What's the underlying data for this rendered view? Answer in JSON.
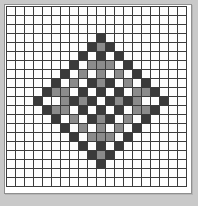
{
  "app": {
    "title": "Pixel Grid Editor",
    "canvas_name": "pattern-canvas"
  },
  "grid": {
    "columns": 20,
    "rows": 20,
    "cell_size_px": 9,
    "gridline_color": "#3b3b3b",
    "background_color": "#fdfdfd",
    "border_color": "#8f8f8f",
    "frame_color": "#c9c9c9"
  },
  "palette": {
    "empty": "#fdfdfd",
    "dark": "#3a3a3a",
    "mid": "#8b8b8b"
  },
  "chart_data": {
    "type": "heatmap",
    "xlabel": "",
    "ylabel": "",
    "legend": [
      "empty",
      "dark",
      "mid"
    ],
    "value_colors": {
      "0": "#fdfdfd",
      "1": "#3a3a3a",
      "2": "#8b8b8b"
    },
    "rows": 20,
    "columns": 20,
    "cells": [
      [
        0,
        0,
        0,
        0,
        0,
        0,
        0,
        0,
        0,
        0,
        0,
        0,
        0,
        0,
        0,
        0,
        0,
        0,
        0,
        0
      ],
      [
        0,
        0,
        0,
        0,
        0,
        0,
        0,
        0,
        0,
        0,
        0,
        0,
        0,
        0,
        0,
        0,
        0,
        0,
        0,
        0
      ],
      [
        0,
        0,
        0,
        0,
        0,
        0,
        0,
        0,
        0,
        0,
        0,
        0,
        0,
        0,
        0,
        0,
        0,
        0,
        0,
        0
      ],
      [
        0,
        0,
        0,
        0,
        0,
        0,
        0,
        0,
        0,
        0,
        1,
        0,
        0,
        0,
        0,
        0,
        0,
        0,
        0,
        0
      ],
      [
        0,
        0,
        0,
        0,
        0,
        0,
        0,
        0,
        0,
        1,
        2,
        1,
        0,
        0,
        0,
        0,
        0,
        0,
        0,
        0
      ],
      [
        0,
        0,
        0,
        0,
        0,
        0,
        0,
        0,
        1,
        0,
        1,
        0,
        1,
        0,
        0,
        0,
        0,
        0,
        0,
        0
      ],
      [
        0,
        0,
        0,
        0,
        0,
        0,
        0,
        1,
        0,
        2,
        2,
        2,
        0,
        1,
        0,
        0,
        0,
        0,
        0,
        0
      ],
      [
        0,
        0,
        0,
        0,
        0,
        0,
        1,
        0,
        2,
        0,
        2,
        0,
        2,
        0,
        1,
        0,
        0,
        0,
        0,
        0
      ],
      [
        0,
        0,
        0,
        0,
        0,
        1,
        0,
        2,
        0,
        1,
        2,
        1,
        0,
        2,
        0,
        1,
        0,
        0,
        0,
        0
      ],
      [
        0,
        0,
        0,
        0,
        1,
        2,
        2,
        0,
        1,
        0,
        1,
        0,
        1,
        0,
        2,
        2,
        1,
        0,
        0,
        0
      ],
      [
        0,
        0,
        0,
        1,
        0,
        0,
        2,
        1,
        2,
        1,
        0,
        1,
        2,
        1,
        2,
        0,
        0,
        1,
        0,
        0
      ],
      [
        0,
        0,
        0,
        0,
        1,
        2,
        2,
        0,
        1,
        0,
        1,
        0,
        1,
        0,
        2,
        2,
        1,
        0,
        0,
        0
      ],
      [
        0,
        0,
        0,
        0,
        0,
        1,
        0,
        2,
        0,
        1,
        2,
        1,
        0,
        2,
        0,
        1,
        0,
        0,
        0,
        0
      ],
      [
        0,
        0,
        0,
        0,
        0,
        0,
        1,
        0,
        2,
        0,
        2,
        0,
        2,
        0,
        1,
        0,
        0,
        0,
        0,
        0
      ],
      [
        0,
        0,
        0,
        0,
        0,
        0,
        0,
        1,
        0,
        2,
        2,
        2,
        0,
        1,
        0,
        0,
        0,
        0,
        0,
        0
      ],
      [
        0,
        0,
        0,
        0,
        0,
        0,
        0,
        0,
        1,
        0,
        1,
        0,
        1,
        0,
        0,
        0,
        0,
        0,
        0,
        0
      ],
      [
        0,
        0,
        0,
        0,
        0,
        0,
        0,
        0,
        0,
        1,
        2,
        1,
        0,
        0,
        0,
        0,
        0,
        0,
        0,
        0
      ],
      [
        0,
        0,
        0,
        0,
        0,
        0,
        0,
        0,
        0,
        0,
        1,
        0,
        0,
        0,
        0,
        0,
        0,
        0,
        0,
        0
      ],
      [
        0,
        0,
        0,
        0,
        0,
        0,
        0,
        0,
        0,
        0,
        0,
        0,
        0,
        0,
        0,
        0,
        0,
        0,
        0,
        0
      ],
      [
        0,
        0,
        0,
        0,
        0,
        0,
        0,
        0,
        0,
        0,
        0,
        0,
        0,
        0,
        0,
        0,
        0,
        0,
        0,
        0
      ]
    ]
  }
}
